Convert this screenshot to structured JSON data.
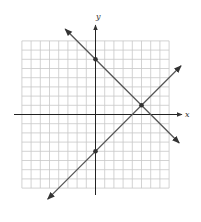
{
  "chart_data": {
    "type": "line",
    "title": "",
    "xlabel": "x",
    "ylabel": "y",
    "xlim": [
      -8,
      8
    ],
    "ylim": [
      -8,
      8
    ],
    "grid": true,
    "grid_step": 1,
    "series": [
      {
        "name": "line-1",
        "equation": "y = -x + 6",
        "slope": -1,
        "intercept": 6,
        "color": "#555555",
        "marked_points": [
          [
            0,
            6
          ],
          [
            5,
            1
          ]
        ]
      },
      {
        "name": "line-2",
        "equation": "y = x - 4",
        "slope": 1,
        "intercept": -4,
        "color": "#555555",
        "marked_points": [
          [
            0,
            -4
          ],
          [
            5,
            1
          ]
        ]
      }
    ],
    "intersection": [
      5,
      1
    ],
    "legend": null
  },
  "labels": {
    "x_axis": "x",
    "y_axis": "y"
  },
  "colors": {
    "grid": "#c8c8c8",
    "axis": "#222222",
    "line": "#555555",
    "point": "#333333"
  }
}
